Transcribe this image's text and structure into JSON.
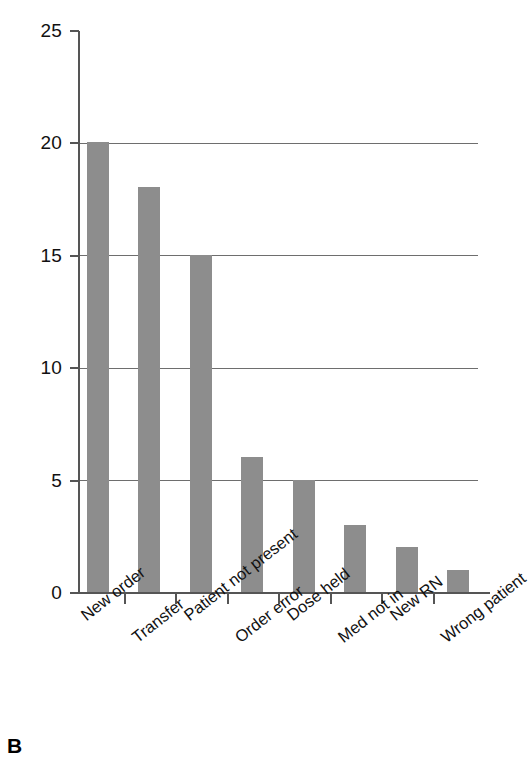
{
  "panel": {
    "letter": "B"
  },
  "chart_data": {
    "type": "bar",
    "title": "",
    "subtitle": "",
    "xlabel": "",
    "ylabel": "",
    "categories": [
      "New order",
      "Transfer",
      "Patient not present",
      "Order error",
      "Dose held",
      "Med not in",
      "New RN",
      "Wrong patient"
    ],
    "values": [
      20,
      18,
      15,
      6,
      5,
      3,
      2,
      1
    ],
    "ylim": [
      0,
      25
    ],
    "yticks": [
      0,
      5,
      10,
      15,
      20,
      25
    ],
    "ytick_labels": [
      "0",
      "5",
      "10",
      "15",
      "20",
      "25"
    ],
    "grid": "horizontal",
    "gridlines_at": [
      5,
      10,
      15,
      20
    ],
    "legend": "none",
    "bar_color": "#8d8d8d",
    "axis_color": "#555555",
    "grid_color": "#6e6e6e",
    "text_color": "#111111",
    "background": "#ffffff",
    "xtick_label_rotation": -38
  }
}
